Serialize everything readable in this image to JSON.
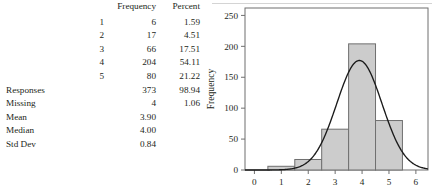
{
  "table": {
    "headers": {
      "label": "",
      "category": "",
      "frequency": "Frequency",
      "percent": "Percent"
    },
    "category_rows": [
      {
        "category": "1",
        "frequency": "6",
        "percent": "1.59"
      },
      {
        "category": "2",
        "frequency": "17",
        "percent": "4.51"
      },
      {
        "category": "3",
        "frequency": "66",
        "percent": "17.51"
      },
      {
        "category": "4",
        "frequency": "204",
        "percent": "54.11"
      },
      {
        "category": "5",
        "frequency": "80",
        "percent": "21.22"
      }
    ],
    "summary_rows": [
      {
        "label": "Responses",
        "frequency": "373",
        "percent": "98.94"
      },
      {
        "label": "Missing",
        "frequency": "4",
        "percent": "1.06"
      },
      {
        "label": "Mean",
        "frequency": "3.90",
        "percent": ""
      },
      {
        "label": "Median",
        "frequency": "4.00",
        "percent": ""
      },
      {
        "label": "Std Dev",
        "frequency": "0.84",
        "percent": ""
      }
    ]
  },
  "chart_data": {
    "type": "bar",
    "title": "",
    "xlabel": "",
    "ylabel": "Frequency",
    "categories": [
      "1",
      "2",
      "3",
      "4",
      "5"
    ],
    "values": [
      6,
      17,
      66,
      204,
      80
    ],
    "bin_edges": [
      0.5,
      1.5,
      2.5,
      3.5,
      4.5,
      5.5
    ],
    "xlim": [
      -0.35,
      6.45
    ],
    "ylim": [
      0,
      262
    ],
    "xticks": [
      "0",
      "1",
      "2",
      "3",
      "4",
      "5",
      "6"
    ],
    "xtick_values": [
      0,
      1,
      2,
      3,
      4,
      5,
      6
    ],
    "yticks": [
      "0",
      "50",
      "100",
      "150",
      "200",
      "250"
    ],
    "ytick_values": [
      0,
      50,
      100,
      150,
      200,
      250
    ],
    "grid": false,
    "legend": false,
    "overlay": {
      "type": "line",
      "name": "normal-curve",
      "mean": 3.9,
      "std_dev": 0.84,
      "n": 373,
      "bin_width": 1,
      "peak_value": 176,
      "color": "#1a1a1a"
    },
    "colors": {
      "bar_fill": "#cccccc",
      "bar_stroke": "#6f6f6f",
      "frame": "#6f6f6f",
      "curve": "#1a1a1a"
    }
  }
}
